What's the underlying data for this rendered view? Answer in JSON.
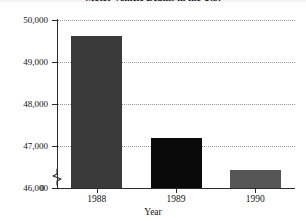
{
  "chart_data": {
    "type": "bar",
    "title": "Motor Vehicle Deaths in the U.S.",
    "xlabel": "Year",
    "ylabel": "",
    "categories": [
      "1988",
      "1989",
      "1990"
    ],
    "values": [
      49620,
      47200,
      46440
    ],
    "series": [
      {
        "name": "Motor vehicle deaths",
        "values": [
          49620,
          47200,
          46440
        ]
      }
    ],
    "ylim": [
      46000,
      50000
    ],
    "yticks": [
      46000,
      47000,
      48000,
      49000,
      50000
    ],
    "ytick_labels": [
      "46,000",
      "47,000",
      "48,000",
      "49,000",
      "50,000"
    ],
    "zero_label": "0",
    "axis_break": true,
    "grid": true,
    "grid_style": "dotted-horizontal",
    "legend": "none",
    "bar_colors": [
      "#3a3a3a",
      "#0a0a0a",
      "#565656"
    ]
  },
  "axis": {
    "x_name": "Year",
    "tick_1988": "1988",
    "tick_1989": "1989",
    "tick_1990": "1990"
  }
}
